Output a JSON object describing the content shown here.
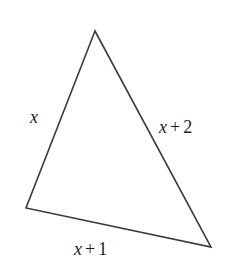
{
  "figure": {
    "type": "geometry-diagram",
    "shape": "triangle",
    "background_color": "#ffffff",
    "stroke_color": "#3a3a3a",
    "stroke_width": 1.6,
    "fill": "none",
    "width": 233,
    "height": 271,
    "vertices": [
      {
        "name": "apex",
        "x": 95,
        "y": 31
      },
      {
        "name": "bottom-left",
        "x": 26,
        "y": 208
      },
      {
        "name": "bottom-right",
        "x": 211,
        "y": 247
      }
    ],
    "path": "M 95,31 L 26,208 L 211,247 Z"
  },
  "labels": {
    "left": {
      "text": "x",
      "variable": "x",
      "operator": "",
      "constant": "",
      "side": "apex-to-bottom-left"
    },
    "right": {
      "text": "x + 2",
      "variable": "x",
      "operator": "+",
      "constant": "2",
      "side": "apex-to-bottom-right"
    },
    "bottom": {
      "text": "x + 1",
      "variable": "x",
      "operator": "+",
      "constant": "1",
      "side": "bottom-left-to-bottom-right"
    }
  }
}
